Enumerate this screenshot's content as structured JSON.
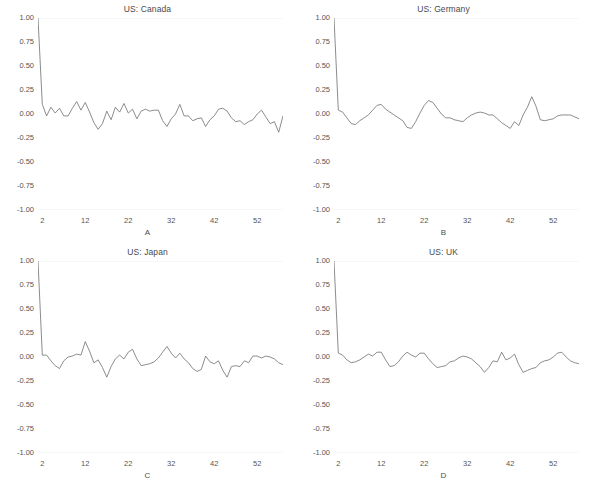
{
  "figure": {
    "width": 591,
    "height": 486,
    "background": "#ffffff",
    "line_color": "#6e6e6e",
    "text_color": "#4a4a4a",
    "layout": "2x2 grid of autocorrelation plots"
  },
  "chart_data": [
    {
      "type": "line",
      "title": "US: Canada",
      "panel_letter": "A",
      "xlabel": "A",
      "ylabel": "",
      "grid": false,
      "legend": "none",
      "xlim": [
        1,
        58
      ],
      "ylim": [
        -1.0,
        1.0
      ],
      "xticks": [
        2,
        12,
        22,
        32,
        42,
        52
      ],
      "xticklabels": [
        "2",
        "12",
        "22",
        "32",
        "42",
        "52"
      ],
      "yticks": [
        1.0,
        0.75,
        0.5,
        0.25,
        0.0,
        -0.25,
        -0.5,
        -0.75,
        -1.0
      ],
      "yticklabels": [
        "1.00",
        "0.75",
        "0.50",
        "0.25",
        "0.00",
        "-0.25",
        "-0.50",
        "-0.75",
        "-1.00"
      ],
      "x": [
        1,
        2,
        3,
        4,
        5,
        6,
        7,
        8,
        9,
        10,
        11,
        12,
        13,
        14,
        15,
        16,
        17,
        18,
        19,
        20,
        21,
        22,
        23,
        24,
        25,
        26,
        27,
        28,
        29,
        30,
        31,
        32,
        33,
        34,
        35,
        36,
        37,
        38,
        39,
        40,
        41,
        42,
        43,
        44,
        45,
        46,
        47,
        48,
        49,
        50,
        51,
        52,
        53,
        54,
        55,
        56,
        57,
        58
      ],
      "values": [
        1.0,
        0.1,
        -0.02,
        0.07,
        0.01,
        0.06,
        -0.02,
        -0.02,
        0.06,
        0.13,
        0.04,
        0.12,
        0.02,
        -0.09,
        -0.16,
        -0.1,
        0.03,
        -0.06,
        0.07,
        0.02,
        0.11,
        0.01,
        0.05,
        -0.05,
        0.03,
        0.05,
        0.03,
        0.04,
        0.04,
        -0.07,
        -0.13,
        -0.05,
        0.0,
        0.1,
        -0.02,
        -0.02,
        -0.07,
        -0.05,
        -0.04,
        -0.13,
        -0.06,
        -0.02,
        0.05,
        0.06,
        0.03,
        -0.04,
        -0.08,
        -0.07,
        -0.11,
        -0.08,
        -0.06,
        0.0,
        0.04,
        -0.03,
        -0.1,
        -0.08,
        -0.19,
        -0.02
      ]
    },
    {
      "type": "line",
      "title": "US: Germany",
      "panel_letter": "B",
      "xlabel": "B",
      "ylabel": "",
      "grid": false,
      "legend": "none",
      "xlim": [
        1,
        58
      ],
      "ylim": [
        -1.0,
        1.0
      ],
      "xticks": [
        2,
        12,
        22,
        32,
        42,
        52
      ],
      "xticklabels": [
        "2",
        "12",
        "22",
        "32",
        "42",
        "52"
      ],
      "yticks": [
        1.0,
        0.75,
        0.5,
        0.25,
        0.0,
        -0.25,
        -0.5,
        -0.75,
        -1.0
      ],
      "yticklabels": [
        "1.00",
        "0.75",
        "0.50",
        "0.25",
        "0.00",
        "-0.25",
        "-0.50",
        "-0.75",
        "-1.00"
      ],
      "x": [
        1,
        2,
        3,
        4,
        5,
        6,
        7,
        8,
        9,
        10,
        11,
        12,
        13,
        14,
        15,
        16,
        17,
        18,
        19,
        20,
        21,
        22,
        23,
        24,
        25,
        26,
        27,
        28,
        29,
        30,
        31,
        32,
        33,
        34,
        35,
        36,
        37,
        38,
        39,
        40,
        41,
        42,
        43,
        44,
        45,
        46,
        47,
        48,
        49,
        50,
        51,
        52,
        53,
        54,
        55,
        56,
        57,
        58
      ],
      "values": [
        1.0,
        0.04,
        0.02,
        -0.04,
        -0.1,
        -0.11,
        -0.07,
        -0.04,
        -0.01,
        0.04,
        0.09,
        0.1,
        0.05,
        0.02,
        -0.01,
        -0.04,
        -0.07,
        -0.14,
        -0.15,
        -0.08,
        0.01,
        0.09,
        0.14,
        0.12,
        0.06,
        0.0,
        -0.04,
        -0.04,
        -0.06,
        -0.07,
        -0.08,
        -0.04,
        -0.01,
        0.01,
        0.02,
        0.01,
        -0.01,
        -0.01,
        -0.05,
        -0.09,
        -0.12,
        -0.15,
        -0.08,
        -0.12,
        -0.01,
        0.07,
        0.18,
        0.08,
        -0.06,
        -0.07,
        -0.06,
        -0.05,
        -0.02,
        -0.01,
        -0.01,
        -0.01,
        -0.03,
        -0.05
      ]
    },
    {
      "type": "line",
      "title": "US: Japan",
      "panel_letter": "C",
      "xlabel": "C",
      "ylabel": "",
      "grid": false,
      "legend": "none",
      "xlim": [
        1,
        58
      ],
      "ylim": [
        -1.0,
        1.0
      ],
      "xticks": [
        2,
        12,
        22,
        32,
        42,
        52
      ],
      "xticklabels": [
        "2",
        "12",
        "22",
        "32",
        "42",
        "52"
      ],
      "yticks": [
        1.0,
        0.75,
        0.5,
        0.25,
        0.0,
        -0.25,
        -0.5,
        -0.75,
        -1.0
      ],
      "yticklabels": [
        "1.00",
        "0.75",
        "0.50",
        "0.25",
        "0.00",
        "-0.25",
        "-0.50",
        "-0.75",
        "-1.00"
      ],
      "x": [
        1,
        2,
        3,
        4,
        5,
        6,
        7,
        8,
        9,
        10,
        11,
        12,
        13,
        14,
        15,
        16,
        17,
        18,
        19,
        20,
        21,
        22,
        23,
        24,
        25,
        26,
        27,
        28,
        29,
        30,
        31,
        32,
        33,
        34,
        35,
        36,
        37,
        38,
        39,
        40,
        41,
        42,
        43,
        44,
        45,
        46,
        47,
        48,
        49,
        50,
        51,
        52,
        53,
        54,
        55,
        56,
        57,
        58
      ],
      "values": [
        1.0,
        0.02,
        0.02,
        -0.04,
        -0.09,
        -0.12,
        -0.04,
        0.0,
        0.01,
        0.03,
        0.02,
        0.16,
        0.06,
        -0.06,
        -0.03,
        -0.11,
        -0.21,
        -0.1,
        -0.02,
        0.02,
        -0.02,
        0.05,
        0.08,
        -0.02,
        -0.09,
        -0.08,
        -0.07,
        -0.05,
        -0.01,
        0.05,
        0.11,
        0.04,
        -0.01,
        0.04,
        -0.02,
        -0.06,
        -0.12,
        -0.15,
        -0.13,
        0.01,
        -0.05,
        -0.07,
        -0.04,
        -0.14,
        -0.21,
        -0.1,
        -0.09,
        -0.1,
        -0.04,
        -0.06,
        0.01,
        0.01,
        -0.01,
        0.01,
        0.0,
        -0.02,
        -0.06,
        -0.08
      ]
    },
    {
      "type": "line",
      "title": "US: UK",
      "panel_letter": "D",
      "xlabel": "D",
      "ylabel": "",
      "grid": false,
      "legend": "none",
      "xlim": [
        1,
        58
      ],
      "ylim": [
        -1.0,
        1.0
      ],
      "xticks": [
        2,
        12,
        22,
        32,
        42,
        52
      ],
      "xticklabels": [
        "2",
        "12",
        "22",
        "32",
        "42",
        "52"
      ],
      "yticks": [
        1.0,
        0.75,
        0.5,
        0.25,
        0.0,
        -0.25,
        -0.5,
        -0.75,
        -1.0
      ],
      "yticklabels": [
        "1.00",
        "0.75",
        "0.50",
        "0.25",
        "0.00",
        "-0.25",
        "-0.50",
        "-0.75",
        "-1.00"
      ],
      "x": [
        1,
        2,
        3,
        4,
        5,
        6,
        7,
        8,
        9,
        10,
        11,
        12,
        13,
        14,
        15,
        16,
        17,
        18,
        19,
        20,
        21,
        22,
        23,
        24,
        25,
        26,
        27,
        28,
        29,
        30,
        31,
        32,
        33,
        34,
        35,
        36,
        37,
        38,
        39,
        40,
        41,
        42,
        43,
        44,
        45,
        46,
        47,
        48,
        49,
        50,
        51,
        52,
        53,
        54,
        55,
        56,
        57,
        58
      ],
      "values": [
        1.0,
        0.04,
        0.02,
        -0.03,
        -0.06,
        -0.05,
        -0.03,
        0.0,
        0.03,
        0.01,
        0.05,
        0.05,
        -0.03,
        -0.1,
        -0.09,
        -0.05,
        0.01,
        0.05,
        0.02,
        0.0,
        0.04,
        0.04,
        -0.02,
        -0.07,
        -0.11,
        -0.1,
        -0.09,
        -0.05,
        -0.04,
        -0.01,
        0.01,
        0.0,
        -0.02,
        -0.06,
        -0.1,
        -0.16,
        -0.11,
        -0.04,
        -0.05,
        0.05,
        -0.03,
        -0.01,
        0.03,
        -0.08,
        -0.16,
        -0.14,
        -0.12,
        -0.11,
        -0.06,
        -0.04,
        -0.03,
        0.0,
        0.04,
        0.05,
        0.0,
        -0.04,
        -0.06,
        -0.07
      ]
    }
  ]
}
